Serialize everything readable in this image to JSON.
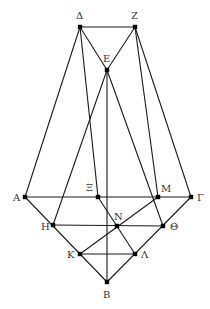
{
  "figure": {
    "width": 210,
    "height": 309,
    "line_color": "#1a1a1a",
    "point_color": "#000000",
    "label_color": "#333333"
  },
  "points": [
    {
      "id": "Delta",
      "label": "Δ",
      "x": 80,
      "y": 27,
      "lx": 76,
      "ly": 19
    },
    {
      "id": "Z",
      "label": "Z",
      "x": 135,
      "y": 27,
      "lx": 131,
      "ly": 19
    },
    {
      "id": "E",
      "label": "E",
      "x": 107,
      "y": 70,
      "lx": 103,
      "ly": 62
    },
    {
      "id": "A",
      "label": "A",
      "x": 25,
      "y": 197,
      "lx": 13,
      "ly": 201
    },
    {
      "id": "Xi",
      "label": "Ξ",
      "x": 98,
      "y": 197,
      "lx": 86,
      "ly": 191
    },
    {
      "id": "M",
      "label": "M",
      "x": 158,
      "y": 197,
      "lx": 161,
      "ly": 192
    },
    {
      "id": "Gamma",
      "label": "Γ",
      "x": 191,
      "y": 197,
      "lx": 197,
      "ly": 201
    },
    {
      "id": "H",
      "label": "H",
      "x": 53,
      "y": 225,
      "lx": 41,
      "ly": 230
    },
    {
      "id": "N",
      "label": "N",
      "x": 117,
      "y": 226,
      "lx": 114,
      "ly": 220
    },
    {
      "id": "Theta",
      "label": "Θ",
      "x": 163,
      "y": 226,
      "lx": 170,
      "ly": 230
    },
    {
      "id": "K",
      "label": "K",
      "x": 80,
      "y": 254,
      "lx": 67,
      "ly": 258
    },
    {
      "id": "Lambda",
      "label": "Λ",
      "x": 135,
      "y": 254,
      "lx": 141,
      "ly": 258
    },
    {
      "id": "B",
      "label": "B",
      "x": 107,
      "y": 282,
      "lx": 103,
      "ly": 298
    }
  ],
  "segments": [
    [
      "Delta",
      "Z"
    ],
    [
      "Delta",
      "E"
    ],
    [
      "Z",
      "E"
    ],
    [
      "Delta",
      "A"
    ],
    [
      "Delta",
      "Xi"
    ],
    [
      "Z",
      "M"
    ],
    [
      "Z",
      "Gamma"
    ],
    [
      "E",
      "B"
    ],
    [
      "E",
      "H"
    ],
    [
      "E",
      "Theta"
    ],
    [
      "A",
      "Gamma"
    ],
    [
      "A",
      "B"
    ],
    [
      "Gamma",
      "B"
    ],
    [
      "H",
      "Theta"
    ],
    [
      "K",
      "Lambda"
    ],
    [
      "M",
      "K"
    ],
    [
      "Xi",
      "Lambda"
    ]
  ]
}
